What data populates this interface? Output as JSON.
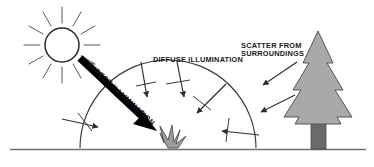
{
  "figure": {
    "background_color": "#ffffff",
    "width": 374,
    "height": 167
  },
  "labels": {
    "direct": "DIRECT ILLUMINATION",
    "diffuse": "DIFFUSE ILLUMINATION",
    "scatter_line1": "SCATTER FROM",
    "scatter_line2": "SURROUNDINGS"
  },
  "colors": {
    "line": "#3a3a3a",
    "text": "#1a1a1a",
    "arrow_direct": "#000000",
    "tree_foliage": "#a9a9a9",
    "tree_foliage_stroke": "#555555",
    "tree_trunk": "#6a6a6a",
    "tree_trunk_stroke": "#4a4a4a",
    "plant": "#9c9c9c",
    "plant_stroke": "#4f4f4f",
    "ground": "#707070",
    "sun_stroke": "#2b2b2b"
  },
  "elements": {
    "sun": {
      "cx": 62,
      "cy": 45,
      "r": 17,
      "ray_count": 12,
      "ray_inner": 22,
      "ray_outer": 38
    },
    "hemisphere": {
      "cx": 168,
      "cy": 148,
      "r": 88
    },
    "ground": {
      "x1": 10,
      "y1": 149,
      "x2": 366,
      "y2": 149
    },
    "plant": {
      "x": 168,
      "y": 148
    },
    "tree": {
      "x": 318,
      "y": 148,
      "height": 118
    },
    "direct_arrow": {
      "x1": 80,
      "y1": 58,
      "x2": 157,
      "y2": 131
    }
  }
}
